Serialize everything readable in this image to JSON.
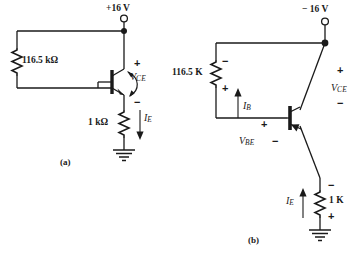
{
  "figure": {
    "background_color": "#ffffff",
    "line_color": "#1a1a1a"
  },
  "circuit_a": {
    "caption": "(a)",
    "supply_label": "+16 V",
    "resistor_base": "116.5 kΩ",
    "resistor_emitter": "1 kΩ",
    "current_emitter": "I",
    "current_emitter_sub": "E",
    "voltage_ce": "V",
    "voltage_ce_sub": "CE",
    "polarity_plus": "+",
    "polarity_minus": "−",
    "ground_icon": "ground-icon",
    "terminal_icon": "open-terminal-icon",
    "junction_icon": "junction-dot-icon",
    "transistor_icon": "npn-transistor-icon"
  },
  "circuit_b": {
    "caption": "(b)",
    "supply_label": "− 16 V",
    "resistor_base": "116.5 K",
    "resistor_emitter": "1 K",
    "current_base": "I",
    "current_base_sub": "B",
    "current_emitter": "I",
    "current_emitter_sub": "E",
    "voltage_ce": "V",
    "voltage_ce_sub": "CE",
    "voltage_be": "V",
    "voltage_be_sub": "BE",
    "polarity_plus": "+",
    "polarity_minus": "−",
    "ground_icon": "ground-icon",
    "terminal_icon": "open-terminal-icon",
    "junction_icon": "junction-dot-icon",
    "transistor_icon": "pnp-transistor-icon"
  }
}
